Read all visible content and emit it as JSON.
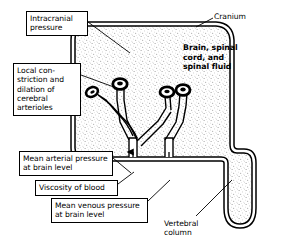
{
  "figure": {
    "background_color": "#ffffff",
    "line_color": "#000000",
    "stipple_color": "#9a9a9a"
  },
  "labels": {
    "intracranial_pressure": "Intracranial\npressure",
    "cranium": "Cranium",
    "brain_contents": "Brain, spinal\ncord, and\nspinal fluid",
    "local_constriction": "Local con-\nstriction and\ndilation of\ncerebral\narterioles",
    "mean_arterial_pressure": "Mean arterial pressure\nat brain level",
    "viscosity_of_blood": "Viscosity of blood",
    "mean_venous_pressure": "Mean venous pressure\nat brain level",
    "vertebral_column": "Vertebral\ncolumn"
  },
  "anatomy": {
    "cranium_outline": "double-line rounded skull cavity",
    "vertebral_canal": "narrow U-shaped downward extension",
    "arterial_trunk": "vertical tube with upward flow arrow",
    "venous_trunk": "vertical tube with downward flow arrow",
    "arterioles": [
      "left diagonal arteriole with looped tip",
      "center upright arteriole with looped tip",
      "right upright arteriole with looped tip"
    ]
  }
}
